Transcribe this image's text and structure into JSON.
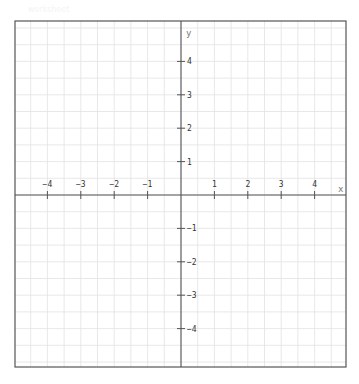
{
  "watermark": {
    "text": "worksheet"
  },
  "chart_data": {
    "type": "coordinate-plane",
    "title": "",
    "xlabel": "x",
    "ylabel": "y",
    "xlim": [
      -5,
      5
    ],
    "ylim": [
      -5,
      5
    ],
    "x_ticks": [
      -4,
      -3,
      -2,
      -1,
      1,
      2,
      3,
      4
    ],
    "y_ticks": [
      4,
      3,
      2,
      1,
      -1,
      -2,
      -3,
      -4
    ],
    "x_tick_labels": [
      "−4",
      "−3",
      "−2",
      "−1",
      "1",
      "2",
      "3",
      "4"
    ],
    "y_tick_labels": [
      "4",
      "3",
      "2",
      "1",
      "−1",
      "−2",
      "−3",
      "−4"
    ],
    "grid": true,
    "grid_step": 0.5,
    "series": []
  },
  "colors": {
    "border": "#555555",
    "axis": "#555555",
    "grid": "#e2e2e2",
    "label": "#333333"
  }
}
